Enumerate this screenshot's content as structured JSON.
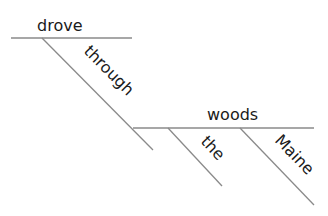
{
  "diagram": {
    "type": "sentence-diagram",
    "words": {
      "verb": "drove",
      "preposition": "through",
      "object": "woods",
      "modifier_1": "the",
      "modifier_2": "Maine"
    },
    "line_color": "#8a8a8a",
    "text_color": "#1a1a1a"
  }
}
